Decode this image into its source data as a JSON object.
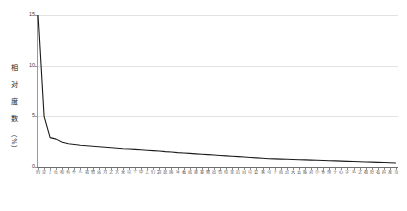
{
  "chart_data": {
    "type": "line",
    "title": "",
    "xlabel": "",
    "ylabel": "相对度数（%）",
    "ylabel_chars": [
      "相",
      "对",
      "度",
      "数"
    ],
    "ylabel_unit": "（%）",
    "ylim": [
      0,
      15
    ],
    "yticks": [
      0,
      5,
      10,
      15
    ],
    "ytick_labels": [
      "0",
      "5",
      "10",
      "15"
    ],
    "grid": true,
    "grid_axis": "y",
    "legend": null,
    "legend_position": "none",
    "line_color": "#1a1a1a",
    "grid_color": "#e2e2e2",
    "axis_color": "#8a8a8a",
    "categories": [
      "的",
      "是",
      "了",
      "在",
      "和",
      "有",
      "不",
      "人",
      "我",
      "他",
      "这",
      "为",
      "之",
      "大",
      "来",
      "以",
      "个",
      "中",
      "上",
      "们",
      "到",
      "说",
      "国",
      "年",
      "着",
      "就",
      "那",
      "要",
      "她",
      "出",
      "也",
      "得",
      "里",
      "后",
      "自",
      "以",
      "会",
      "家",
      "可",
      "下",
      "而",
      "过",
      "天",
      "去",
      "能",
      "对",
      "小",
      "多",
      "然",
      "于",
      "心",
      "学",
      "么",
      "之",
      "都",
      "好",
      "看",
      "起",
      "发",
      "当"
    ],
    "values": [
      15.0,
      5.0,
      2.9,
      2.75,
      2.45,
      2.3,
      2.22,
      2.15,
      2.1,
      2.05,
      2.0,
      1.95,
      1.9,
      1.85,
      1.8,
      1.78,
      1.74,
      1.7,
      1.66,
      1.62,
      1.58,
      1.52,
      1.48,
      1.42,
      1.38,
      1.34,
      1.3,
      1.26,
      1.22,
      1.18,
      1.14,
      1.1,
      1.06,
      1.02,
      0.98,
      0.94,
      0.9,
      0.86,
      0.82,
      0.8,
      0.78,
      0.76,
      0.74,
      0.72,
      0.7,
      0.68,
      0.66,
      0.64,
      0.62,
      0.6,
      0.58,
      0.56,
      0.54,
      0.52,
      0.5,
      0.48,
      0.46,
      0.44,
      0.42,
      0.4
    ]
  }
}
